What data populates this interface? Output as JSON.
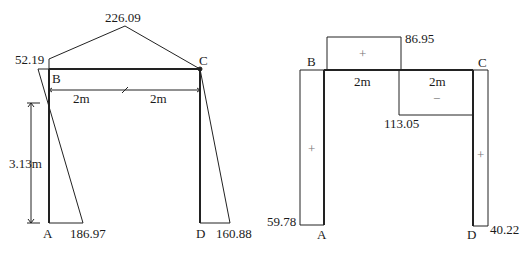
{
  "diagram_left": {
    "title": "Bending moment diagram",
    "nodes": {
      "B": "B",
      "C": "C",
      "A": "A",
      "D": "D"
    },
    "values": {
      "beam_peak": "226.09",
      "at_B": "52.19",
      "at_A": "186.97",
      "at_D": "160.88"
    },
    "dimensions": {
      "span_left": "2m",
      "span_right": "2m",
      "column_height": "3.13m"
    }
  },
  "diagram_right": {
    "title": "Shear force diagram",
    "nodes": {
      "B": "B",
      "C": "C",
      "A": "A",
      "D": "D"
    },
    "values": {
      "beam_positive": "86.95",
      "beam_negative": "113.05",
      "column_left": "59.78",
      "column_right": "40.22"
    },
    "dimensions": {
      "span_left": "2m",
      "span_right": "2m"
    },
    "signs": {
      "beam_left": "+",
      "beam_right": "−",
      "column_left": "+",
      "column_right": "+"
    }
  }
}
